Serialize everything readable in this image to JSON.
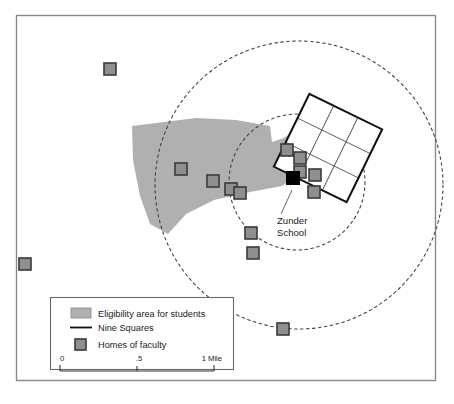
{
  "figure": {
    "kind": "thematic-map",
    "frame_color": "#8a8a8a",
    "background_color": "#ffffff"
  },
  "labels": {
    "school_line1": "Zunder",
    "school_line2": "School"
  },
  "legend": {
    "items": [
      {
        "swatch": "area-swatch",
        "label": "Eligibility area for students"
      },
      {
        "swatch": "line-swatch",
        "label": "Nine Squares"
      },
      {
        "swatch": "square-swatch",
        "label": "Homes of faculty"
      }
    ],
    "scale": {
      "ticks": [
        "0",
        ".5",
        "1 Mile"
      ],
      "unit": "Mile"
    }
  },
  "colors": {
    "eligibility_fill": "#b0b0b0",
    "marker_fill": "#8f8f8f",
    "marker_stroke": "#3a3a3a",
    "school_fill": "#000000",
    "grid_stroke": "#111111",
    "grid_inner_stroke": "#555555",
    "circle_stroke": "#444444",
    "legend_border": "#6a6a6a"
  },
  "map_data": {
    "type": "map",
    "eligibility_polygon": [
      [
        132,
        126
      ],
      [
        196,
        118
      ],
      [
        236,
        120
      ],
      [
        270,
        126
      ],
      [
        272,
        142
      ],
      [
        284,
        138
      ],
      [
        298,
        128
      ],
      [
        310,
        150
      ],
      [
        300,
        172
      ],
      [
        282,
        186
      ],
      [
        250,
        192
      ],
      [
        214,
        200
      ],
      [
        186,
        214
      ],
      [
        168,
        234
      ],
      [
        150,
        224
      ],
      [
        140,
        196
      ],
      [
        133,
        160
      ]
    ],
    "circles": [
      {
        "name": "inner-radius-circle",
        "cx": 297,
        "cy": 182,
        "r": 68
      },
      {
        "name": "outer-radius-circle",
        "cx": 299,
        "cy": 185,
        "r": 144
      }
    ],
    "nine_squares": {
      "rotation_deg": 26,
      "center_x": 328,
      "center_y": 148,
      "cell_size": 27,
      "rows": 3,
      "cols": 3
    },
    "school_marker": {
      "x": 293,
      "y": 178
    },
    "faculty_markers": [
      {
        "x": 110,
        "y": 69
      },
      {
        "x": 25,
        "y": 264
      },
      {
        "x": 181,
        "y": 169
      },
      {
        "x": 213,
        "y": 181
      },
      {
        "x": 231,
        "y": 189
      },
      {
        "x": 240,
        "y": 193
      },
      {
        "x": 251,
        "y": 233
      },
      {
        "x": 253,
        "y": 253
      },
      {
        "x": 283,
        "y": 329
      },
      {
        "x": 287,
        "y": 150
      },
      {
        "x": 300,
        "y": 158
      },
      {
        "x": 300,
        "y": 172
      },
      {
        "x": 315,
        "y": 175
      },
      {
        "x": 314,
        "y": 192
      }
    ]
  }
}
